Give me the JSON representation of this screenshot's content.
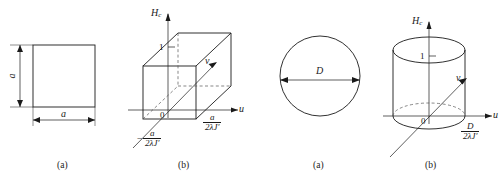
{
  "figure": {
    "background_color": "#ffffff",
    "line_color": "#1a1a1a",
    "dash_color": "#555555",
    "panels": [
      {
        "id": "panel-1",
        "caption": "(a)",
        "kind": "square-cross-section",
        "shape": "square",
        "dimension_labels": {
          "width": "a",
          "height": "a"
        }
      },
      {
        "id": "panel-2",
        "caption": "(b)",
        "kind": "box-3d-axes",
        "shape": "rectangular-box",
        "axes": {
          "vertical": "H",
          "vertical_subscript": "c",
          "horizontal": "u",
          "depth": "v",
          "origin": "0"
        },
        "ticks": {
          "vertical_tick": "1"
        },
        "extent_labels": [
          {
            "position": "right",
            "numerator": "a",
            "denominator": "2λJ′",
            "sign": ""
          },
          {
            "position": "front-left",
            "numerator": "a",
            "denominator": "2λJ′",
            "sign": "−"
          }
        ]
      },
      {
        "id": "panel-3",
        "caption": "(a)",
        "kind": "circular-cross-section",
        "shape": "circle",
        "dimension_labels": {
          "diameter": "D"
        }
      },
      {
        "id": "panel-4",
        "caption": "(b)",
        "kind": "cylinder-3d-axes",
        "shape": "cylinder",
        "axes": {
          "vertical": "H",
          "vertical_subscript": "c",
          "horizontal": "u",
          "depth": "v",
          "origin": "0"
        },
        "ticks": {
          "vertical_tick": "1"
        },
        "extent_labels": [
          {
            "position": "right",
            "numerator": "D",
            "denominator": "2λJ′",
            "sign": ""
          }
        ]
      }
    ]
  }
}
